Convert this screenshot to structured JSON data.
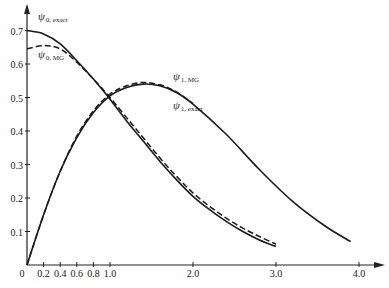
{
  "chart_data": {
    "type": "line",
    "title": "",
    "xlabel": "",
    "ylabel": "",
    "xlim": [
      0,
      4.2
    ],
    "ylim": [
      0,
      0.75
    ],
    "grid": false,
    "legend_position": "inline labels",
    "x_ticks": [
      0,
      0.2,
      0.4,
      0.6,
      0.8,
      1.0,
      2.0,
      3.0,
      4.0
    ],
    "x_tick_labels": [
      "0",
      "0.2",
      "0.4",
      "0.6",
      "0.8",
      "1.0",
      "2.0",
      "3.0",
      "4.0"
    ],
    "y_ticks": [
      0.1,
      0.2,
      0.3,
      0.4,
      0.5,
      0.6,
      0.7
    ],
    "y_tick_labels": [
      "0.1",
      "0.2",
      "0.3",
      "0.4",
      "0.5",
      "0.6",
      "0.7"
    ],
    "series": [
      {
        "name": "ψ0,exact",
        "label_main": "ψ",
        "label_sub": "0, exact",
        "style": "solid",
        "x": [
          0,
          0.2,
          0.4,
          0.6,
          0.8,
          1.0,
          1.2,
          1.4,
          1.6,
          1.8,
          2.0,
          2.2,
          2.4,
          2.6,
          2.8,
          3.0
        ],
        "y": [
          0.7,
          0.69,
          0.66,
          0.61,
          0.555,
          0.495,
          0.43,
          0.37,
          0.31,
          0.255,
          0.205,
          0.165,
          0.13,
          0.1,
          0.075,
          0.055
        ]
      },
      {
        "name": "ψ0,MG",
        "label_main": "ψ",
        "label_sub": "0, MG",
        "style": "dashed",
        "x": [
          0,
          0.2,
          0.4,
          0.6,
          0.8,
          1.0,
          1.2,
          1.4,
          1.6,
          1.8,
          2.0,
          2.2,
          2.4,
          2.6,
          2.8,
          3.0
        ],
        "y": [
          0.645,
          0.655,
          0.645,
          0.605,
          0.555,
          0.5,
          0.44,
          0.38,
          0.32,
          0.265,
          0.215,
          0.175,
          0.14,
          0.11,
          0.085,
          0.062
        ]
      },
      {
        "name": "ψ1,exact",
        "label_main": "ψ",
        "label_sub": "1, exact",
        "style": "solid",
        "x": [
          0,
          0.2,
          0.4,
          0.6,
          0.8,
          1.0,
          1.2,
          1.4,
          1.6,
          1.8,
          2.0,
          2.4,
          2.8,
          3.2,
          3.6,
          3.9
        ],
        "y": [
          0,
          0.15,
          0.28,
          0.38,
          0.455,
          0.505,
          0.53,
          0.54,
          0.535,
          0.515,
          0.48,
          0.39,
          0.285,
          0.19,
          0.115,
          0.07
        ]
      },
      {
        "name": "ψ1,MG",
        "label_main": "ψ",
        "label_sub": "1, MG",
        "style": "dashed",
        "x": [
          0,
          0.2,
          0.4,
          0.6,
          0.8,
          1.0,
          1.2,
          1.4,
          1.6,
          1.8,
          2.0
        ],
        "y": [
          0,
          0.15,
          0.28,
          0.385,
          0.46,
          0.51,
          0.535,
          0.545,
          0.538,
          0.517,
          0.482
        ]
      }
    ]
  },
  "axes": {
    "origin_label": "0"
  }
}
